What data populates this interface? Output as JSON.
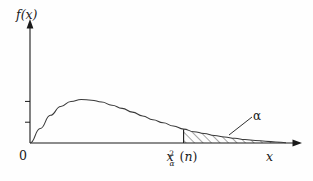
{
  "figure": {
    "kind": "chi-square-density-upper-tail",
    "background_color": "#fefefe",
    "stroke_color": "#1a1a1a"
  },
  "labels": {
    "y_axis": "f(x)",
    "x_axis": "x",
    "origin": "0",
    "alpha": "α",
    "critical_value": {
      "base": "x",
      "superscript": "2",
      "subscript": "α",
      "open_paren": "(",
      "argument": "n",
      "close_paren": ")",
      "full": "xα²(n)"
    }
  },
  "chart_data": {
    "type": "area",
    "title": "",
    "xlabel": "x",
    "ylabel": "f(x)",
    "grid": false,
    "legend": false,
    "xlim": [
      0,
      1
    ],
    "ylim": [
      0,
      1
    ],
    "axis_ticks": {
      "y": [
        0.33,
        0.66
      ],
      "x": []
    },
    "annotations": [
      {
        "name": "alpha-region-callout",
        "text": "α",
        "x": 0.92,
        "y": 0.3
      },
      {
        "name": "critical-value-tick",
        "text": "xα²(n)",
        "x": 0.6,
        "y": 0.0
      }
    ],
    "series": [
      {
        "name": "chi-square density",
        "x": [
          0.0,
          0.04,
          0.08,
          0.12,
          0.16,
          0.2,
          0.24,
          0.28,
          0.32,
          0.36,
          0.4,
          0.44,
          0.48,
          0.52,
          0.56,
          0.6,
          0.64,
          0.68,
          0.72,
          0.76,
          0.8,
          0.84,
          0.88,
          0.92,
          0.96,
          1.0
        ],
        "y": [
          0.0,
          0.23,
          0.44,
          0.58,
          0.66,
          0.69,
          0.68,
          0.65,
          0.6,
          0.55,
          0.49,
          0.43,
          0.37,
          0.32,
          0.27,
          0.22,
          0.18,
          0.15,
          0.12,
          0.095,
          0.074,
          0.056,
          0.041,
          0.028,
          0.016,
          0.005
        ]
      }
    ],
    "shaded_region": {
      "name": "upper-tail-alpha",
      "x_start": 0.6,
      "x_end": 1.0,
      "fill": "hatched-diagonal",
      "label": "α"
    }
  }
}
